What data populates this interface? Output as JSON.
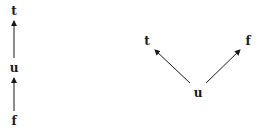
{
  "left_diagram": {
    "nodes": {
      "top": {
        "label": "t",
        "x": 14,
        "y": 11
      },
      "middle": {
        "label": "u",
        "x": 14,
        "y": 68
      },
      "bottom": {
        "label": "f",
        "x": 14,
        "y": 121
      }
    },
    "edges": [
      {
        "from": "u",
        "to": "t"
      },
      {
        "from": "f",
        "to": "u"
      }
    ]
  },
  "right_diagram": {
    "nodes": {
      "left": {
        "label": "t",
        "x": 147,
        "y": 41
      },
      "right": {
        "label": "f",
        "x": 248,
        "y": 41
      },
      "bottom": {
        "label": "u",
        "x": 198,
        "y": 93
      }
    },
    "edges": [
      {
        "from": "u",
        "to": "t"
      },
      {
        "from": "u",
        "to": "f"
      }
    ]
  },
  "colors": {
    "stroke": "#1a1a1a",
    "background": "#ffffff"
  }
}
